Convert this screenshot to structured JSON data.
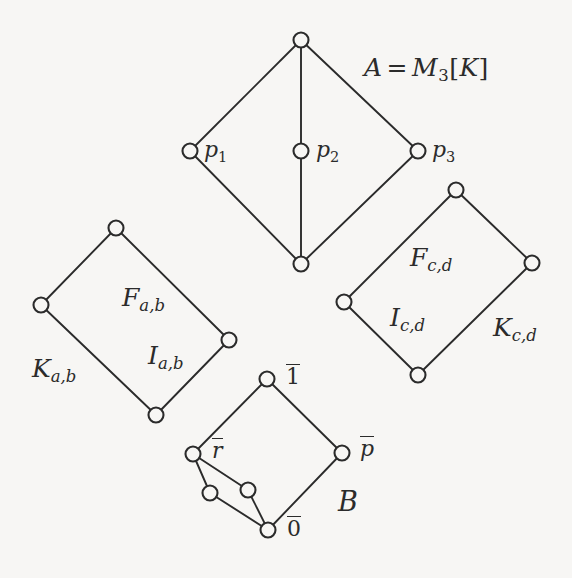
{
  "figure": {
    "type": "hasse-diagram",
    "background_color": "#f7f6f4",
    "ink_color": "#2b2b2b",
    "components": [
      {
        "id": "A",
        "label": "A = M_3[K]",
        "nodes": [
          "top",
          "p1",
          "p2",
          "p3",
          "bottom"
        ]
      },
      {
        "id": "Kab",
        "label": "K_{a,b}",
        "nodes": [
          "top",
          "left",
          "right",
          "bottom"
        ]
      },
      {
        "id": "Kcd",
        "label": "K_{c,d}",
        "nodes": [
          "top",
          "left",
          "right",
          "bottom"
        ]
      },
      {
        "id": "B",
        "label": "B",
        "nodes": [
          "one",
          "r",
          "p",
          "zero",
          "inner-left",
          "inner-right"
        ]
      }
    ]
  },
  "labels": {
    "a_equals": {
      "lhs": "A",
      "operator": "=",
      "rhs_base": "M",
      "rhs_sub": "3",
      "rhs_bracket_open": "[",
      "rhs_arg": "K",
      "rhs_bracket_close": "]",
      "full": "A = M3[K]"
    },
    "p1": {
      "base": "p",
      "sub": "1",
      "full": "p1"
    },
    "p2": {
      "base": "p",
      "sub": "2",
      "full": "p2"
    },
    "p3": {
      "base": "p",
      "sub": "3",
      "full": "p3"
    },
    "f_ab": {
      "base": "F",
      "sub": "a,b",
      "full": "Fa,b"
    },
    "i_ab": {
      "base": "I",
      "sub": "a,b",
      "full": "Ia,b"
    },
    "k_ab": {
      "base": "K",
      "sub": "a,b",
      "full": "Ka,b"
    },
    "f_cd": {
      "base": "F",
      "sub": "c,d",
      "full": "Fc,d"
    },
    "i_cd": {
      "base": "I",
      "sub": "c,d",
      "full": "Ic,d"
    },
    "k_cd": {
      "base": "K",
      "sub": "c,d",
      "full": "Kc,d"
    },
    "b_one": {
      "base": "1",
      "full": "1-bar"
    },
    "b_r": {
      "base": "r",
      "full": "r-bar"
    },
    "b_p": {
      "base": "p",
      "full": "p-bar"
    },
    "b_zero": {
      "base": "0",
      "full": "0-bar"
    },
    "b_name": {
      "base": "B",
      "full": "B"
    }
  },
  "geometry": {
    "width": 572,
    "height": 578,
    "node_radius": 7,
    "A": {
      "top": [
        301,
        40
      ],
      "p1": [
        190,
        151
      ],
      "p2": [
        301,
        151
      ],
      "p3": [
        418,
        151
      ],
      "bottom": [
        301,
        264
      ],
      "edges": [
        [
          "top",
          "p1"
        ],
        [
          "top",
          "p2"
        ],
        [
          "top",
          "p3"
        ],
        [
          "p1",
          "bottom"
        ],
        [
          "p2",
          "bottom"
        ],
        [
          "p3",
          "bottom"
        ]
      ]
    },
    "Kab": {
      "top": [
        116,
        228
      ],
      "left": [
        41,
        305
      ],
      "right": [
        229,
        340
      ],
      "bottom": [
        156,
        415
      ],
      "edges": [
        [
          "top",
          "left"
        ],
        [
          "top",
          "right"
        ],
        [
          "left",
          "bottom"
        ],
        [
          "right",
          "bottom"
        ]
      ]
    },
    "Kcd": {
      "top": [
        456,
        190
      ],
      "left": [
        344,
        302
      ],
      "right": [
        532,
        263
      ],
      "bottom": [
        418,
        375
      ],
      "edges": [
        [
          "top",
          "left"
        ],
        [
          "top",
          "right"
        ],
        [
          "left",
          "bottom"
        ],
        [
          "right",
          "bottom"
        ]
      ]
    },
    "B": {
      "one": [
        267,
        379
      ],
      "r": [
        193,
        454
      ],
      "p": [
        342,
        453
      ],
      "zero": [
        268,
        530
      ],
      "inner_left": [
        210,
        493
      ],
      "inner_right": [
        248,
        490
      ],
      "edges": [
        [
          "one",
          "r"
        ],
        [
          "one",
          "p"
        ],
        [
          "p",
          "zero"
        ],
        [
          "r",
          "inner_left"
        ],
        [
          "r",
          "inner_right"
        ],
        [
          "inner_left",
          "zero"
        ],
        [
          "inner_right",
          "zero"
        ]
      ]
    }
  }
}
